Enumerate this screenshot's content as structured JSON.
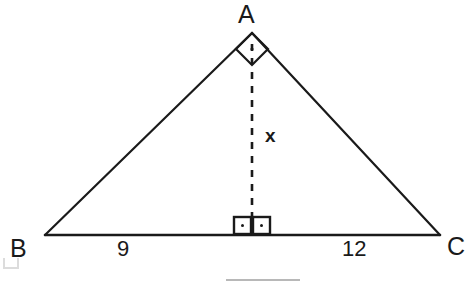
{
  "figure": {
    "type": "right-triangle-with-altitude",
    "background_color": "#ffffff",
    "stroke_color": "#1a1a1a",
    "vertices": {
      "A": {
        "label": "A",
        "x": 252,
        "y": 33
      },
      "B": {
        "label": "B",
        "x": 45,
        "y": 235
      },
      "C": {
        "label": "C",
        "x": 440,
        "y": 235
      },
      "D": {
        "label": "",
        "x": 252,
        "y": 235
      }
    },
    "segments": {
      "base_left_label": "9",
      "base_right_label": "12",
      "altitude_label": "x"
    },
    "markers": {
      "apex_right_angle": "right-angle-diamond-marker",
      "foot_right_angle_left": "right-angle-square-marker",
      "foot_right_angle_right": "right-angle-square-marker"
    },
    "altitude": {
      "style": "dashed",
      "from": "A",
      "to": "D"
    },
    "artifacts": {
      "bottom_rule_color": "#b8b8b8",
      "corner_mark_color": "#d8d8d8"
    }
  }
}
